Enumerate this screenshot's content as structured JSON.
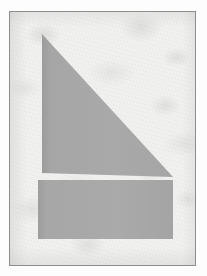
{
  "page": {
    "background_color": "#fdfdfd",
    "width": 207,
    "height": 276
  },
  "plate": {
    "name": "scanned-paper-plate",
    "border_color": "#8d8d8d",
    "paper_color": "#f1f1ef",
    "left": 9,
    "top": 11,
    "width": 187,
    "height": 255
  },
  "figure": {
    "type": "geometric-figure",
    "fill_color": "#a8a8a8",
    "edge_shadow_color": "#9a9a9a",
    "shapes": [
      {
        "name": "right-triangle",
        "kind": "triangle",
        "points": "32,22 32,161 163,165",
        "description": "right triangle with vertical left leg, apex at top-left, hypotenuse descending to lower-right"
      },
      {
        "name": "rectangle-bar",
        "kind": "rectangle",
        "x": 28,
        "y": 168,
        "width": 135,
        "height": 59,
        "description": "horizontal solid bar beneath the triangle"
      }
    ],
    "gap_between_shapes_px": 7
  }
}
